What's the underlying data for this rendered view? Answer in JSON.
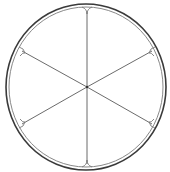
{
  "illustration": {
    "subject": "citrus-slice",
    "segments": 6,
    "colors": {
      "background": "#ffffff",
      "outer_rind": "#3a3a3a",
      "inner_rind": "#7a7a7a",
      "segment_lines": "#5a5a5a"
    }
  }
}
